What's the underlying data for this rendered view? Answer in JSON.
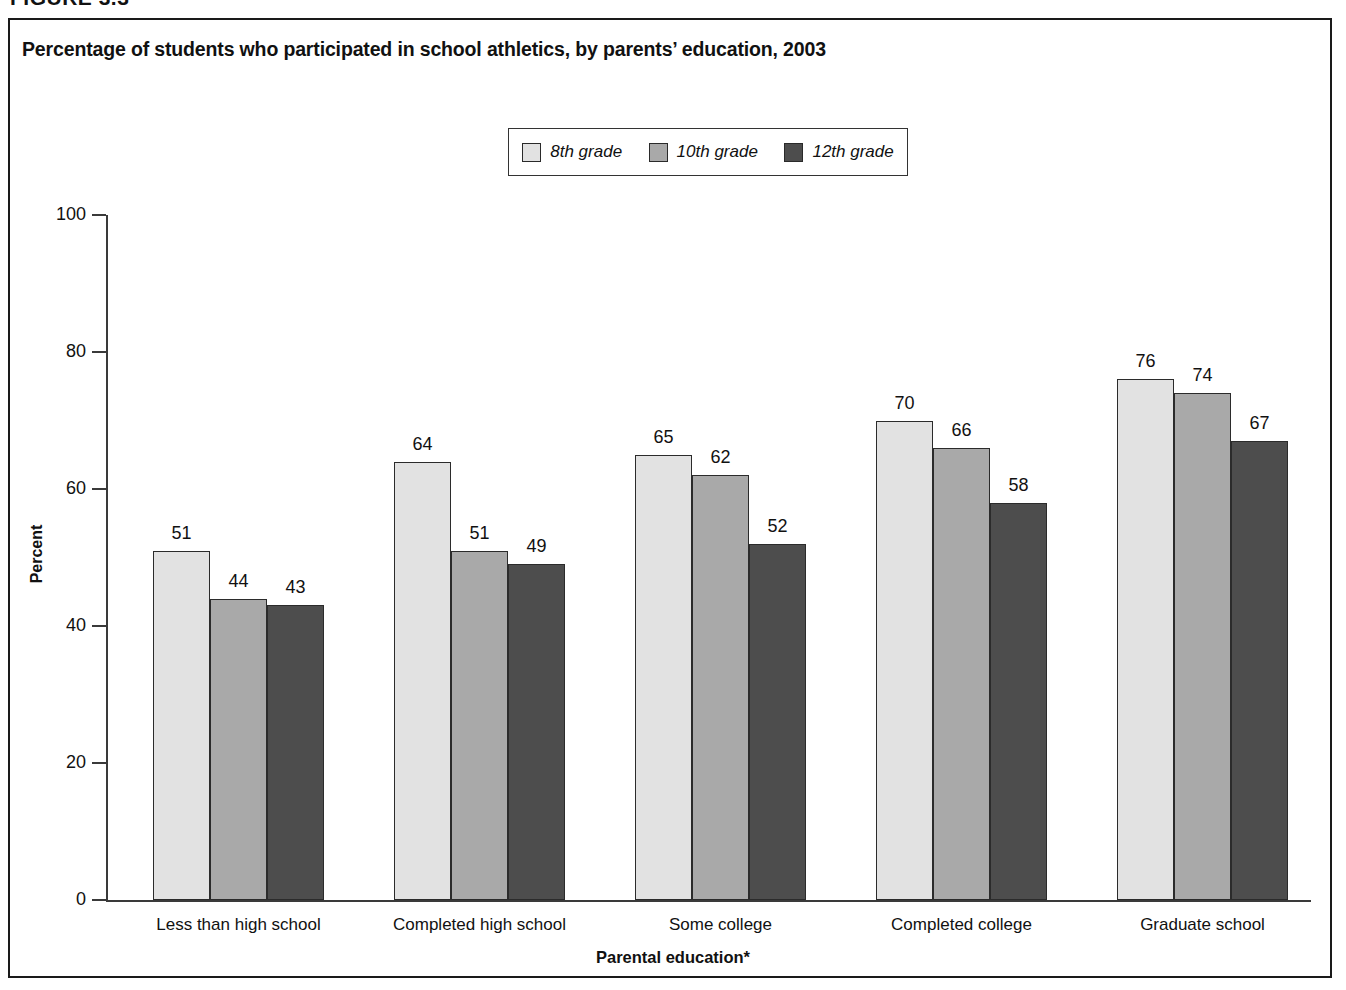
{
  "figure_number": "FIGURE 3.3",
  "chart_title": "Percentage of students who participated in school athletics, by parents’ education, 2003",
  "axis": {
    "y_title": "Percent",
    "x_title": "Parental education*"
  },
  "colors": {
    "series_8th": "#e2e2e2",
    "series_10th": "#a9a9a9",
    "series_12th": "#4d4d4d",
    "axis": "#3a3a3a",
    "text": "#111111",
    "frame": "#1a1a1a",
    "background": "#ffffff"
  },
  "legend": {
    "items": [
      {
        "label": "8th grade",
        "color": "#e2e2e2"
      },
      {
        "label": "10th grade",
        "color": "#a9a9a9"
      },
      {
        "label": "12th grade",
        "color": "#4d4d4d"
      }
    ]
  },
  "chart_data": {
    "type": "bar",
    "title": "Percentage of students who participated in school athletics, by parents’ education, 2003",
    "xlabel": "Parental education*",
    "ylabel": "Percent",
    "ylim": [
      0,
      100
    ],
    "yticks": [
      0,
      20,
      40,
      60,
      80,
      100
    ],
    "grid": false,
    "legend_position": "top-center",
    "categories": [
      "Less than high school",
      "Completed high school",
      "Some college",
      "Completed college",
      "Graduate school"
    ],
    "series": [
      {
        "name": "8th grade",
        "color": "#e2e2e2",
        "values": [
          51,
          64,
          65,
          70,
          76
        ]
      },
      {
        "name": "10th grade",
        "color": "#a9a9a9",
        "values": [
          44,
          51,
          62,
          66,
          74
        ]
      },
      {
        "name": "12th grade",
        "color": "#4d4d4d",
        "values": [
          43,
          49,
          52,
          58,
          67
        ]
      }
    ]
  }
}
